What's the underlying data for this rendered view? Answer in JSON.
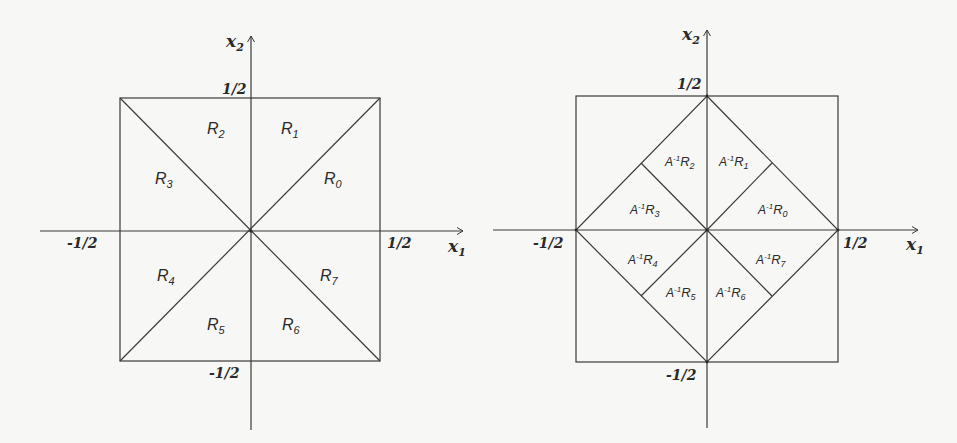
{
  "figure": {
    "panels": [
      {
        "id": "left",
        "axis_x_label": "x",
        "axis_x_sub": "1",
        "axis_y_label": "x",
        "axis_y_sub": "2",
        "ticks": {
          "top": "1/2",
          "bottom": "-1/2",
          "left": "-1/2",
          "right": "1/2"
        },
        "regions": [
          {
            "base": "R",
            "sub": "0"
          },
          {
            "base": "R",
            "sub": "1"
          },
          {
            "base": "R",
            "sub": "2"
          },
          {
            "base": "R",
            "sub": "3"
          },
          {
            "base": "R",
            "sub": "4"
          },
          {
            "base": "R",
            "sub": "5"
          },
          {
            "base": "R",
            "sub": "6"
          },
          {
            "base": "R",
            "sub": "7"
          }
        ]
      },
      {
        "id": "right",
        "axis_x_label": "x",
        "axis_x_sub": "1",
        "axis_y_label": "x",
        "axis_y_sub": "2",
        "ticks": {
          "top": "1/2",
          "bottom": "-1/2",
          "left": "-1/2",
          "right": "1/2"
        },
        "region_prefix": "A",
        "region_prefix_sup": "-1",
        "regions": [
          {
            "base": "R",
            "sub": "0"
          },
          {
            "base": "R",
            "sub": "1"
          },
          {
            "base": "R",
            "sub": "2"
          },
          {
            "base": "R",
            "sub": "3"
          },
          {
            "base": "R",
            "sub": "4"
          },
          {
            "base": "R",
            "sub": "5"
          },
          {
            "base": "R",
            "sub": "6"
          },
          {
            "base": "R",
            "sub": "7"
          }
        ]
      }
    ],
    "colors": {
      "line": "#3a3a3a",
      "text": "#2a2a2a",
      "background": "#f7f7f5"
    }
  }
}
